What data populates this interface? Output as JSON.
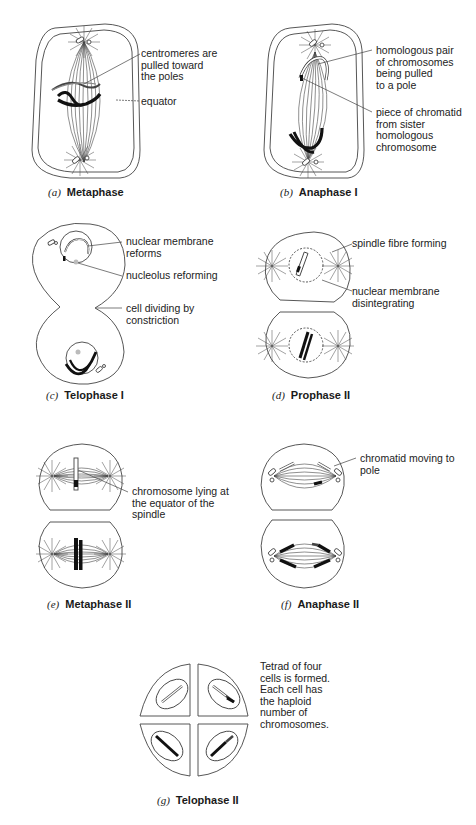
{
  "figure": {
    "panels": [
      {
        "id": "a",
        "letter": "(a)",
        "name": "Metaphase",
        "labels": [
          "centromeres are\npulled toward\nthe poles",
          "equator"
        ]
      },
      {
        "id": "b",
        "letter": "(b)",
        "name": "Anaphase I",
        "labels": [
          "homologous pair\nof chromosomes\nbeing pulled\nto a pole",
          "piece of chromatid\nfrom sister\nhomologous\nchromosome"
        ]
      },
      {
        "id": "c",
        "letter": "(c)",
        "name": "Telophase I",
        "labels": [
          "nuclear membrane\nreforms",
          "nucleolus reforming",
          "cell dividing by\nconstriction"
        ]
      },
      {
        "id": "d",
        "letter": "(d)",
        "name": "Prophase II",
        "labels": [
          "spindle fibre forming",
          "nuclear membrane\ndisintegrating"
        ]
      },
      {
        "id": "e",
        "letter": "(e)",
        "name": "Metaphase II",
        "labels": [
          "chromosome lying at\nthe equator of the\nspindle"
        ]
      },
      {
        "id": "f",
        "letter": "(f)",
        "name": "Anaphase II",
        "labels": [
          "chromatid moving to\npole"
        ]
      },
      {
        "id": "g",
        "letter": "(g)",
        "name": "Telophase II",
        "labels": [
          "Tetrad of four\ncells is formed.\nEach cell has\nthe haploid\nnumber of\nchromosomes."
        ]
      }
    ]
  },
  "colors": {
    "line": "#444444",
    "chromosome": "#111111",
    "background": "#ffffff"
  }
}
